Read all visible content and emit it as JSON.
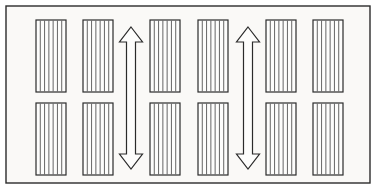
{
  "figure": {
    "background_color": "#faf9f7",
    "line_color": "#2b2b2b",
    "stripe_color": "#555555",
    "canvas": {
      "width": 378,
      "height": 196
    }
  },
  "border": {
    "name": "outer-frame",
    "x": 6,
    "y": 6,
    "width": 364,
    "height": 177,
    "stroke_width": 1.4,
    "fill": "#faf9f7"
  },
  "block_geometry": {
    "width": 30,
    "height": 72,
    "stripe_count": 7,
    "stroke_width": 1.2,
    "row_y": [
      20,
      103
    ],
    "column_x": [
      36,
      83,
      150,
      198,
      266,
      313
    ]
  },
  "blocks": [
    {
      "id": "block-r1c1",
      "label": "top-row-bay-1",
      "row": 1,
      "column": 1,
      "x": 36,
      "y": 20,
      "width": 30,
      "height": 72,
      "stripes": 7
    },
    {
      "id": "block-r1c2",
      "label": "top-row-bay-2",
      "row": 1,
      "column": 2,
      "x": 83,
      "y": 20,
      "width": 30,
      "height": 72,
      "stripes": 7
    },
    {
      "id": "block-r1c3",
      "label": "top-row-bay-3",
      "row": 1,
      "column": 3,
      "x": 150,
      "y": 20,
      "width": 30,
      "height": 72,
      "stripes": 7
    },
    {
      "id": "block-r1c4",
      "label": "top-row-bay-4",
      "row": 1,
      "column": 4,
      "x": 198,
      "y": 20,
      "width": 30,
      "height": 72,
      "stripes": 7
    },
    {
      "id": "block-r1c5",
      "label": "top-row-bay-5",
      "row": 1,
      "column": 5,
      "x": 266,
      "y": 20,
      "width": 30,
      "height": 72,
      "stripes": 7
    },
    {
      "id": "block-r1c6",
      "label": "top-row-bay-6",
      "row": 1,
      "column": 6,
      "x": 313,
      "y": 20,
      "width": 30,
      "height": 72,
      "stripes": 7
    },
    {
      "id": "block-r2c1",
      "label": "bottom-row-bay-1",
      "row": 2,
      "column": 1,
      "x": 36,
      "y": 103,
      "width": 30,
      "height": 72,
      "stripes": 7
    },
    {
      "id": "block-r2c2",
      "label": "bottom-row-bay-2",
      "row": 2,
      "column": 2,
      "x": 83,
      "y": 103,
      "width": 30,
      "height": 72,
      "stripes": 7
    },
    {
      "id": "block-r2c3",
      "label": "bottom-row-bay-3",
      "row": 2,
      "column": 3,
      "x": 150,
      "y": 103,
      "width": 30,
      "height": 72,
      "stripes": 7
    },
    {
      "id": "block-r2c4",
      "label": "bottom-row-bay-4",
      "row": 2,
      "column": 4,
      "x": 198,
      "y": 103,
      "width": 30,
      "height": 72,
      "stripes": 7
    },
    {
      "id": "block-r2c5",
      "label": "bottom-row-bay-5",
      "row": 2,
      "column": 5,
      "x": 266,
      "y": 103,
      "width": 30,
      "height": 72,
      "stripes": 7
    },
    {
      "id": "block-r2c6",
      "label": "bottom-row-bay-6",
      "row": 2,
      "column": 6,
      "x": 313,
      "y": 103,
      "width": 30,
      "height": 72,
      "stripes": 7
    }
  ],
  "arrows": [
    {
      "id": "arrow-aisle-left",
      "label": "left-circulation-aisle-arrow",
      "direction": "double-vertical",
      "center_x": 131,
      "top_y": 27,
      "bottom_y": 169,
      "shaft_width": 9,
      "head_width": 23,
      "head_height": 15,
      "stroke_width": 1.2
    },
    {
      "id": "arrow-aisle-right",
      "label": "right-circulation-aisle-arrow",
      "direction": "double-vertical",
      "center_x": 248,
      "top_y": 27,
      "bottom_y": 169,
      "shaft_width": 9,
      "head_width": 23,
      "head_height": 15,
      "stroke_width": 1.2
    }
  ]
}
